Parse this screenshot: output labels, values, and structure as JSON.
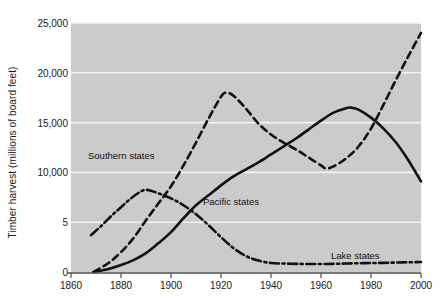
{
  "chart_data": {
    "type": "line",
    "title": "",
    "xlabel": "",
    "ylabel": "Timber harvest (millions of board feet)",
    "xlim": [
      1860,
      2000
    ],
    "ylim": [
      0,
      25000
    ],
    "grid": true,
    "legend_position": "inline-annotations",
    "x_ticks": [
      "1860",
      "1880",
      "1900",
      "1920",
      "1940",
      "1960",
      "1980",
      "2000"
    ],
    "y_ticks": [
      "0",
      "5",
      "10,000",
      "15,000",
      "20,000",
      "25,000"
    ],
    "y_tick_values": [
      0,
      5000,
      10000,
      15000,
      20000,
      25000
    ],
    "series": [
      {
        "name": "Southern states",
        "style": "dashed",
        "color": "#111111",
        "x": [
          1869,
          1875,
          1880,
          1885,
          1890,
          1895,
          1900,
          1905,
          1910,
          1915,
          1920,
          1922,
          1925,
          1930,
          1935,
          1940,
          1945,
          1950,
          1955,
          1960,
          1962,
          1965,
          1970,
          1975,
          1980,
          1985,
          1990,
          1995,
          2000
        ],
        "y": [
          0,
          900,
          2000,
          3400,
          5200,
          6900,
          8600,
          10700,
          13000,
          15400,
          17600,
          18000,
          17700,
          16400,
          14900,
          13800,
          13000,
          12300,
          11500,
          10700,
          10400,
          10600,
          11400,
          12600,
          14400,
          16800,
          19300,
          21700,
          24000
        ]
      },
      {
        "name": "Pacific states",
        "style": "solid",
        "color": "#111111",
        "x": [
          1869,
          1875,
          1880,
          1885,
          1890,
          1895,
          1900,
          1905,
          1910,
          1915,
          1920,
          1925,
          1930,
          1935,
          1940,
          1945,
          1950,
          1955,
          1960,
          1965,
          1970,
          1972,
          1975,
          1980,
          1985,
          1990,
          1995,
          2000
        ],
        "y": [
          0,
          300,
          700,
          1200,
          1900,
          2900,
          4000,
          5400,
          6700,
          7700,
          8700,
          9600,
          10300,
          11000,
          11800,
          12600,
          13400,
          14300,
          15200,
          16000,
          16450,
          16500,
          16300,
          15500,
          14400,
          13000,
          11200,
          9100
        ]
      },
      {
        "name": "Lake states",
        "style": "dash-dot",
        "color": "#111111",
        "x": [
          1868,
          1872,
          1876,
          1880,
          1884,
          1888,
          1890,
          1892,
          1896,
          1900,
          1905,
          1910,
          1915,
          1920,
          1925,
          1930,
          1935,
          1940,
          1945,
          1950,
          1955,
          1960,
          1965,
          1970,
          1975,
          1980,
          1985,
          1990,
          1995,
          2000
        ],
        "y": [
          3700,
          4600,
          5600,
          6500,
          7400,
          8100,
          8250,
          8150,
          7800,
          7400,
          6700,
          5800,
          4700,
          3500,
          2400,
          1600,
          1150,
          900,
          850,
          820,
          800,
          800,
          820,
          850,
          880,
          900,
          920,
          950,
          980,
          1000
        ]
      }
    ],
    "annotations": [
      {
        "name": "southern-states-label",
        "text": "Southern states",
        "x_px": 88,
        "y_px": 150
      },
      {
        "name": "pacific-states-label",
        "text": "Pacific states",
        "x_px": 203,
        "y_px": 196
      },
      {
        "name": "lake-states-label",
        "text": "Lake states",
        "x_px": 331,
        "y_px": 250
      }
    ]
  },
  "colors": {
    "plot_background": "#cbcbcb",
    "gridline": "#f2f2f2",
    "axis": "#4d4d4d",
    "line": "#111111",
    "text": "#1a1a1a",
    "page_background": "#ffffff"
  }
}
